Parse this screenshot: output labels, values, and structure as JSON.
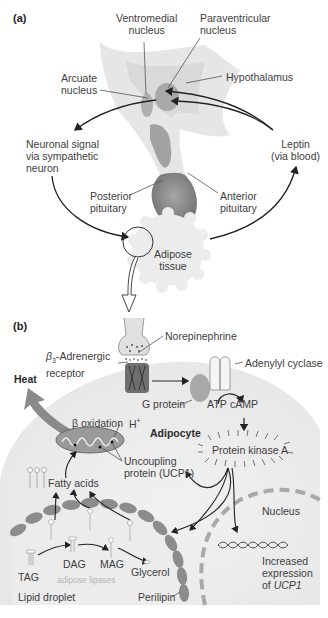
{
  "panel_a": {
    "label": "(a)",
    "ventromedial": [
      "Ventromedial",
      "nucleus"
    ],
    "paraventricular": [
      "Paraventricular",
      "nucleus"
    ],
    "arcuate": [
      "Arcuate",
      "nucleus"
    ],
    "hypothalamus": "Hypothalamus",
    "neuronal_signal": [
      "Neuronal signal",
      "via sympathetic",
      "neuron"
    ],
    "leptin": [
      "Leptin",
      "(via blood)"
    ],
    "posterior_pituitary": [
      "Posterior",
      "pituitary"
    ],
    "anterior_pituitary": [
      "Anterior",
      "pituitary"
    ],
    "adipose_tissue": [
      "Adipose",
      "tissue"
    ]
  },
  "panel_b": {
    "label": "(b)",
    "norepinephrine": "Norepinephrine",
    "beta3_receptor": {
      "beta": "β",
      "sub": "3",
      "rest": "-Adrenergic",
      "line2": "receptor"
    },
    "adenylyl_cyclase": "Adenylyl cyclase",
    "heat": "Heat",
    "g_protein": "G protein",
    "atp": "ATP",
    "camp": "cAMP",
    "beta_oxidation": "β oxidation",
    "h_plus": {
      "base": "H",
      "sup": "+"
    },
    "adipocyte": "Adipocyte",
    "protein_kinase_a": "Protein kinase A",
    "uncoupling_protein": [
      "Uncoupling",
      "protein (UCP1)"
    ],
    "fatty_acids": "Fatty acids",
    "nucleus": "Nucleus",
    "tag": "TAG",
    "dag": "DAG",
    "mag": "MAG",
    "glycerol": "Glycerol",
    "adipose_lipases": "adipose lipases",
    "increased_expression": {
      "line1": "Increased",
      "line2": "expression",
      "line3_prefix": "of ",
      "gene": "UCP1"
    },
    "lipid_droplet": "Lipid droplet",
    "perilipin": "Perilipin"
  },
  "colors": {
    "brain_light": "#e4e4e4",
    "brain_mid": "#cfcfcf",
    "nucleus_gray": "#a8a8a8",
    "pituitary": "#8a8a8a",
    "heat_arrow": "#8a8a8a",
    "cell_bg": "#efefef",
    "droplet_membrane": "#8c8c8c",
    "nucleus_dash": "#a9a9a9",
    "arrow": "#222222"
  }
}
